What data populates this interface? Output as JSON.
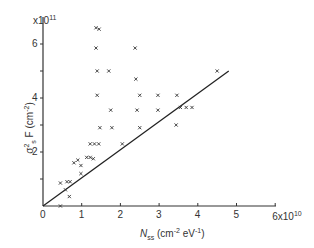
{
  "chart_data": {
    "type": "scatter",
    "title": "",
    "xlabel": "N_ss (cm^-2 eV^-1)",
    "ylabel": "σ_s^2 F (cm^-2)",
    "x_multiplier": "x10^10",
    "y_multiplier": "x10^11",
    "xlim": [
      0,
      6
    ],
    "ylim": [
      0,
      7
    ],
    "x_ticks": [
      "0",
      "1",
      "2",
      "3",
      "4",
      "5",
      "6x10^10"
    ],
    "y_ticks": [
      "2",
      "4",
      "6"
    ],
    "grid": false,
    "legend": "none",
    "marker": "x",
    "series": [
      {
        "name": "measured",
        "points": [
          [
            1.37,
            6.6
          ],
          [
            1.45,
            6.55
          ],
          [
            1.37,
            5.85
          ],
          [
            2.38,
            5.85
          ],
          [
            1.4,
            5.0
          ],
          [
            1.7,
            5.0
          ],
          [
            4.5,
            5.0
          ],
          [
            2.4,
            4.7
          ],
          [
            1.4,
            4.1
          ],
          [
            2.5,
            4.1
          ],
          [
            2.97,
            4.1
          ],
          [
            3.46,
            4.1
          ],
          [
            1.75,
            3.55
          ],
          [
            2.43,
            3.55
          ],
          [
            2.97,
            3.55
          ],
          [
            3.44,
            3.0
          ],
          [
            1.47,
            2.9
          ],
          [
            1.78,
            2.9
          ],
          [
            2.5,
            2.9
          ],
          [
            3.55,
            3.65
          ],
          [
            3.7,
            3.65
          ],
          [
            3.85,
            3.65
          ],
          [
            1.22,
            2.3
          ],
          [
            1.33,
            2.3
          ],
          [
            1.44,
            2.3
          ],
          [
            2.05,
            2.3
          ],
          [
            1.13,
            1.8
          ],
          [
            1.22,
            1.8
          ],
          [
            1.3,
            1.75
          ],
          [
            0.8,
            1.6
          ],
          [
            0.9,
            1.7
          ],
          [
            0.98,
            1.5
          ],
          [
            0.98,
            1.2
          ],
          [
            0.45,
            0.85
          ],
          [
            0.62,
            0.9
          ],
          [
            0.7,
            0.9
          ],
          [
            0.58,
            0.6
          ],
          [
            0.68,
            0.35
          ],
          [
            0.45,
            0.0
          ]
        ]
      }
    ],
    "fit_line": {
      "x": [
        0,
        4.8
      ],
      "y": [
        0,
        5.0
      ]
    }
  },
  "axes": {
    "x_tick_labels": [
      "0",
      "1",
      "2",
      "3",
      "4",
      "5",
      "6x10"
    ],
    "x_tick_exp": "10",
    "y_tick_labels": [
      "2",
      "4",
      "6"
    ],
    "y_mult_base": "x10",
    "y_mult_exp": "11",
    "xlabel_sym": "N",
    "xlabel_sub": "ss",
    "xlabel_units_a": "(cm",
    "xlabel_units_exp1": "-2",
    "xlabel_units_b": " eV",
    "xlabel_units_exp2": "-1",
    "xlabel_units_c": ")",
    "ylabel_sym": "σ",
    "ylabel_sub": "s",
    "ylabel_sup": "2",
    "ylabel_F": " F (cm",
    "ylabel_exp": "-2",
    "ylabel_close": ")"
  }
}
